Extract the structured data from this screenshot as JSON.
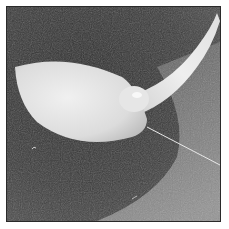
{
  "image": {
    "description": "Grayscale photograph of a white plastic teardrop-shaped paddle (spoon-like) with a curved handle resting on a dark textured sponge-like surface; a thin white thread extends from the paddle tip toward the lower right.",
    "style": "grayscale photo with thin dark border on white background",
    "colors": {
      "background": "#ffffff",
      "border": "#2a2a2a",
      "surface_dark": "#3a3a3a",
      "surface_light": "#8a8a8a",
      "object": "#e2e2e2"
    }
  }
}
